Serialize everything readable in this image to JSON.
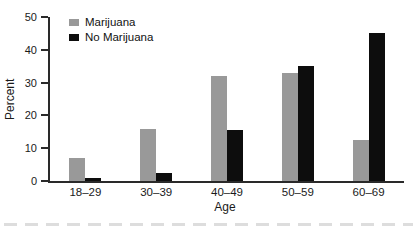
{
  "chart_data": {
    "type": "bar",
    "title": "",
    "categories": [
      "18–29",
      "30–39",
      "40–49",
      "50–59",
      "60–69"
    ],
    "series": [
      {
        "name": "Marijuana",
        "color": "#999999",
        "values": [
          7,
          16,
          32,
          33,
          12.5
        ]
      },
      {
        "name": "No Marijuana",
        "color": "#0d0d0d",
        "values": [
          1,
          2.5,
          15.5,
          35,
          45
        ]
      }
    ],
    "xlabel": "Age",
    "ylabel": "Percent",
    "ylim": [
      0,
      50
    ],
    "yticks": [
      0,
      10,
      20,
      30,
      40,
      50
    ],
    "grid": false,
    "legend_position": "top-left-inside",
    "axis_color": "#2a2a2a",
    "background_color": "#ffffff"
  }
}
